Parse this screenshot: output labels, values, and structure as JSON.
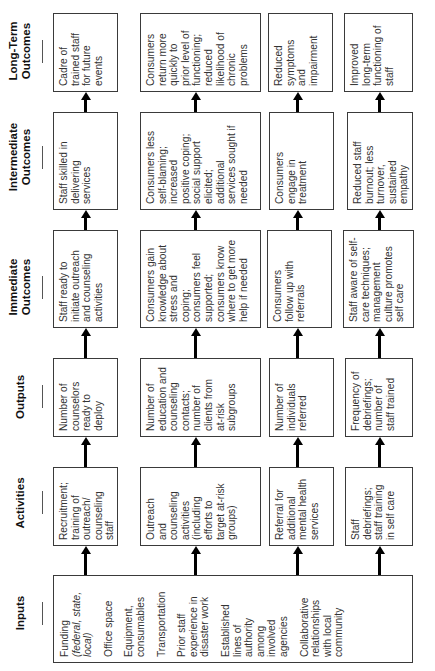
{
  "diagram": {
    "type": "logic-model",
    "orientation": "rotated-90-ccw",
    "stages": [
      {
        "key": "long_term",
        "label": "Long-Term\nOutcomes"
      },
      {
        "key": "intermediate",
        "label": "Intermediate\nOutcomes"
      },
      {
        "key": "immediate",
        "label": "Immediate\nOutcomes"
      },
      {
        "key": "outputs",
        "label": "Outputs"
      },
      {
        "key": "activities",
        "label": "Activities"
      },
      {
        "key": "inputs",
        "label": "Inputs"
      }
    ],
    "inputs": {
      "items": [
        {
          "text": "Funding",
          "italic": "(federal, state,\nlocal)"
        },
        {
          "text": "Office space"
        },
        {
          "text": "Equipment,\nconsumables"
        },
        {
          "text": "Transportation"
        },
        {
          "text": "Prior staff\nexperience in\ndisaster work"
        },
        {
          "text": "Established\nlines of\nauthority\namong\ninvolved\nagencies"
        },
        {
          "text": "Collaborative\nrelationships\nwith local\ncommunity"
        }
      ]
    },
    "chains": [
      {
        "activities": "Recruitment;\ntraining of\noutreach/\ncounseling\nstaff",
        "outputs": "Number of\ncounselors\nready to\ndeploy",
        "immediate": "Staff ready to\ninitiate outreach\nand counseling\nactivities",
        "intermediate": "Staff skilled in\ndelivering\nservices",
        "long_term": "Cadre of\ntrained staff\nfor future\nevents"
      },
      {
        "activities": "Outreach\nand\ncounseling\nactivities\n(including\nefforts to\ntarget at-risk\ngroups)",
        "outputs": "Number of\neducation and\ncounseling\ncontacts;\nnumber of\nclients from\nat-risk\nsubgroups",
        "immediate": "Consumers gain\nknowledge about\nstress and\ncoping;\nconsumers feel\nsupported;\nconsumers know\nwhere to get more\nhelp if needed",
        "intermediate": "Consumers less\nself-blaming;\nincreased\npositive coping;\nsocial support\nelicited;\nadditional\nservices sought if\nneeded",
        "long_term": "Consumers\nreturn more\nquickly to\nprior level of\nfunctioning;\nreduced\nlikelihood of\nchronic\nproblems"
      },
      {
        "activities": "Referral for\nadditional\nmental health\nservices",
        "outputs": "Number of\nindividuals\nreferred",
        "immediate": "Consumers\nfollow up with\nreferrals",
        "intermediate": "Consumers\nengage in\ntreatment",
        "long_term": "Reduced\nsymptoms\nand\nimpairment"
      },
      {
        "activities": "Staff\ndebriefings;\nstaff training\nin self care",
        "outputs": "Frequency of\ndebriefings;\nnumber of\nstaff trained",
        "immediate": "Staff aware of self-\ncare techniques;\nmanagement\nculture promotes\nself care",
        "intermediate": "Reduced staff\nburnout; less\nturnover,\nsustained\nempathy",
        "long_term": "Improved\nlong-term\nfunctioning of\nstaff"
      }
    ],
    "colors": {
      "border": "#3a3a3a",
      "arrow": "#000000",
      "text": "#333333",
      "background": "#ffffff"
    }
  }
}
